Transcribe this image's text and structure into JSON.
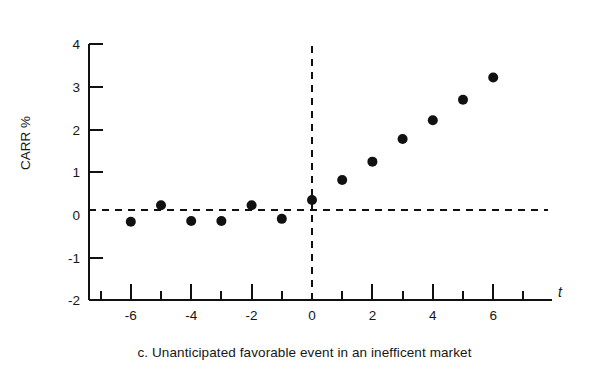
{
  "chart_data": {
    "type": "scatter",
    "title": "",
    "caption": "c. Unanticipated favorable event in an inefficent market",
    "xlabel": "t",
    "ylabel": "CARR %",
    "x": [
      -6,
      -5,
      -4,
      -3,
      -2,
      -1,
      0,
      1,
      2,
      3,
      4,
      5,
      6
    ],
    "values": [
      -0.16,
      0.23,
      -0.14,
      -0.14,
      0.23,
      -0.09,
      0.35,
      0.82,
      1.25,
      1.78,
      2.22,
      2.7,
      3.22
    ],
    "series": [
      {
        "name": "CARR %",
        "values": [
          -0.16,
          0.23,
          -0.14,
          -0.14,
          0.23,
          -0.09,
          0.35,
          0.82,
          1.25,
          1.78,
          2.22,
          2.7,
          3.22
        ]
      }
    ],
    "xlim": [
      -7.5,
      7.0
    ],
    "ylim": [
      -2,
      4
    ],
    "x_ticks": [
      -7,
      -6,
      -5,
      -4,
      -3,
      -2,
      -1,
      0,
      1,
      2,
      3,
      4,
      5,
      6,
      7
    ],
    "x_tick_labels": [
      "",
      "-6",
      "",
      "-4",
      "",
      "-2",
      "",
      "0",
      "",
      "2",
      "",
      "4",
      "",
      "6",
      ""
    ],
    "y_ticks": [
      -2,
      -1,
      0,
      1,
      2,
      3,
      4
    ],
    "y_tick_labels": [
      "-2",
      "-1",
      "0",
      "1",
      "2",
      "3",
      "4"
    ],
    "grid": false,
    "legend": "none",
    "annotations": [
      {
        "name": "zero-reference-line",
        "kind": "horizontal-dashed",
        "y": 0.12
      },
      {
        "name": "event-date-line",
        "kind": "vertical-dashed",
        "x": 0
      }
    ],
    "marker": {
      "shape": "circle",
      "color": "#111111",
      "radius": 5.0
    },
    "colors": {
      "axis": "#111111",
      "marker": "#111111",
      "dashed": "#111111",
      "text": "#161616",
      "background": "#ffffff"
    }
  },
  "axis_titles": {
    "y": "CARR %",
    "x": "t"
  },
  "caption": "c. Unanticipated favorable event in an inefficent market",
  "y_tick_labels": [
    "4",
    "3",
    "2",
    "1",
    "0",
    "-1",
    "-2"
  ],
  "x_tick_labels": [
    "-6",
    "-4",
    "-2",
    "0",
    "2",
    "4",
    "6"
  ]
}
